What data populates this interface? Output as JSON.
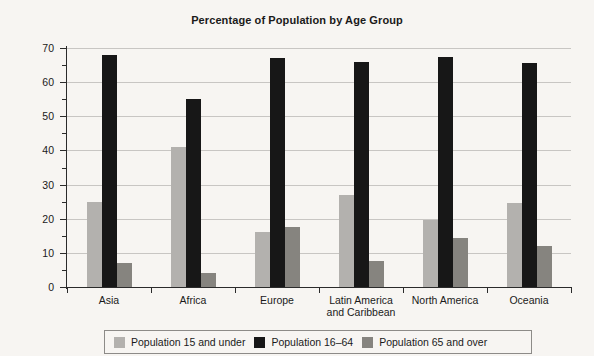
{
  "chart_data": {
    "type": "bar",
    "title": "Percentage of Population by Age Group",
    "xlabel": "",
    "ylabel": "Percentage of Population",
    "ylim": [
      0,
      70
    ],
    "ytick_step": 10,
    "yticks": [
      0,
      10,
      20,
      30,
      40,
      50,
      60,
      70
    ],
    "ytick_labels": [
      "0",
      "10",
      "20",
      "30",
      "40",
      "50",
      "60",
      "70"
    ],
    "minor_tick_step": 5,
    "grid": true,
    "legend_position": "bottom",
    "categories": [
      "Asia",
      "Africa",
      "Europe",
      "Latin America and Caribbean",
      "North America",
      "Oceania"
    ],
    "category_lines": [
      [
        "Asia"
      ],
      [
        "Africa"
      ],
      [
        "Europe"
      ],
      [
        "Latin America",
        "and Caribbean"
      ],
      [
        "North America"
      ],
      [
        "Oceania"
      ]
    ],
    "series": [
      {
        "name": "Population 15 and under",
        "color": "#b3b1ae",
        "values": [
          25,
          41,
          16,
          27,
          19.5,
          24.5
        ]
      },
      {
        "name": "Population 16–64",
        "color": "#171717",
        "values": [
          68,
          55,
          67,
          66,
          67.5,
          65.5
        ]
      },
      {
        "name": "Population 65 and over",
        "color": "#86847f",
        "values": [
          7,
          4,
          17.5,
          7.5,
          14.5,
          12
        ]
      }
    ]
  },
  "colors": {
    "background": "#f7f5f2",
    "axis": "#2b2b2b",
    "gridline": "#c8c6c3",
    "text": "#1a1a1a",
    "legend_border": "#8d8b88"
  }
}
